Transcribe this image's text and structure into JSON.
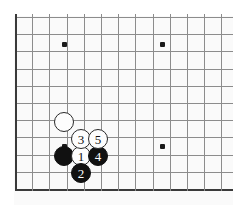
{
  "figure": {
    "kind": "go-board-diagram",
    "background_color": "#ffffff",
    "board_color": "#fafafa",
    "line_color": "#8c8c8c",
    "edge_line_color": "#3a3a3a",
    "black_stone_color": "#111111",
    "white_stone_color": "#fdfdfd",
    "black_label_color": "#ffffff",
    "white_label_color": "#111111"
  },
  "board": {
    "cell_size": 17.2,
    "origin_x": 15,
    "origin_y": 17,
    "columns": 13,
    "rows": 11,
    "left_edge_label": "board-left-edge",
    "bottom_edge_label": "board-bottom-edge",
    "top_edge_label": "board-top-edge"
  },
  "star_points": [
    {
      "name": "star-point-upper-left",
      "x": 64,
      "y": 44
    },
    {
      "name": "star-point-upper-right",
      "x": 162,
      "y": 44
    },
    {
      "name": "star-point-lower-left",
      "x": 64,
      "y": 146
    },
    {
      "name": "star-point-lower-right",
      "x": 162,
      "y": 146
    }
  ],
  "stones": [
    {
      "name": "white-stone-existing-upper",
      "color": "white",
      "label": "",
      "x": 64,
      "y": 122
    },
    {
      "name": "black-stone-existing-corner",
      "color": "black",
      "label": "",
      "x": 64,
      "y": 156
    },
    {
      "name": "white-stone-move-1",
      "color": "white",
      "label": "1",
      "x": 81,
      "y": 156
    },
    {
      "name": "black-stone-move-2",
      "color": "black",
      "label": "2",
      "x": 81,
      "y": 173
    },
    {
      "name": "white-stone-move-3",
      "color": "white",
      "label": "3",
      "x": 81,
      "y": 139
    },
    {
      "name": "black-stone-move-4",
      "color": "black",
      "label": "4",
      "x": 98,
      "y": 156
    },
    {
      "name": "white-stone-move-5",
      "color": "white",
      "label": "5",
      "x": 98,
      "y": 139
    }
  ]
}
